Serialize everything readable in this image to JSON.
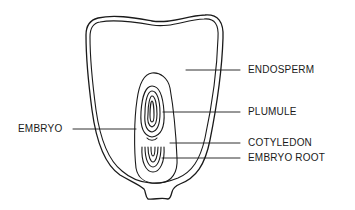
{
  "diagram": {
    "colors": {
      "stroke": "#1a1a1a",
      "background": "#ffffff"
    },
    "labels": {
      "endosperm": "ENDOSPERM",
      "plumule": "PLUMULE",
      "embryo": "EMBRYO",
      "cotyledon": "COTYLEDON",
      "embryo_root": "EMBRYO ROOT"
    }
  }
}
